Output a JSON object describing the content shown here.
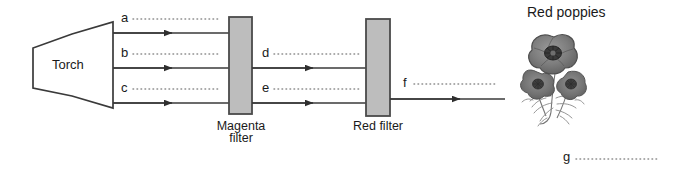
{
  "figure": {
    "background_color": "#ffffff",
    "line_color": "#3a3a3a",
    "filter_fill_color": "#bdbdbd",
    "filter_stroke_color": "#4a4a4a",
    "text_color": "#1a1a1a"
  },
  "source": {
    "label": "Torch"
  },
  "filters": [
    {
      "name": "magenta-filter",
      "line1": "Magenta",
      "line2": "filter"
    },
    {
      "name": "red-filter",
      "line1": "Red filter",
      "line2": ""
    }
  ],
  "rays": [
    {
      "id": "a",
      "letter": "a",
      "section": "torch-to-magenta"
    },
    {
      "id": "b",
      "letter": "b",
      "section": "torch-to-magenta"
    },
    {
      "id": "c",
      "letter": "c",
      "section": "torch-to-magenta"
    },
    {
      "id": "d",
      "letter": "d",
      "section": "magenta-to-red"
    },
    {
      "id": "e",
      "letter": "e",
      "section": "magenta-to-red"
    },
    {
      "id": "f",
      "letter": "f",
      "section": "after-red"
    }
  ],
  "object": {
    "caption": "Red poppies",
    "illustration": "poppy-flowers-engraving"
  },
  "answer_blanks": [
    {
      "id": "g",
      "letter": "g"
    }
  ]
}
